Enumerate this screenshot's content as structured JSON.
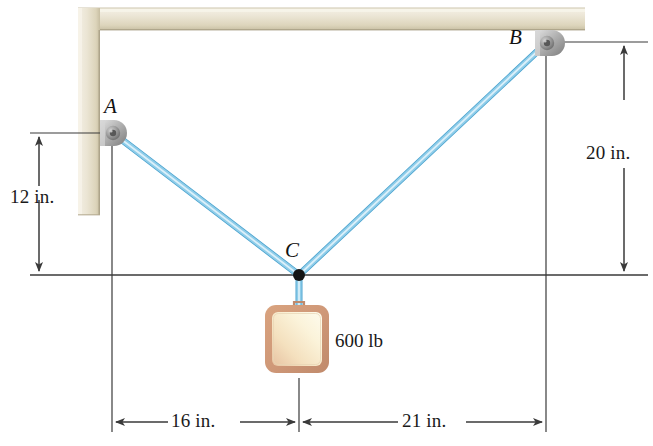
{
  "figure": {
    "background_color": "#ffffff"
  },
  "points": [
    {
      "id": "A",
      "label": "A",
      "label_x": 106,
      "label_y": 97,
      "x": 112,
      "y": 133,
      "role": "left-wall-anchor"
    },
    {
      "id": "B",
      "label": "B",
      "label_x": 511,
      "label_y": 28,
      "x": 546,
      "y": 42,
      "role": "ceiling-anchor"
    },
    {
      "id": "C",
      "label": "C",
      "label_x": 286,
      "label_y": 240,
      "x": 299,
      "y": 275,
      "role": "cable-junction"
    }
  ],
  "dimensions": [
    {
      "id": "dim-12in",
      "label": "12 in.",
      "orientation": "vertical",
      "value": 12,
      "unit": "in.",
      "axis_x": 39,
      "from_y": 133,
      "to_y": 275,
      "label_x": 10,
      "label_y": 192
    },
    {
      "id": "dim-20in",
      "label": "20 in.",
      "orientation": "vertical",
      "value": 20,
      "unit": "in.",
      "axis_x": 624,
      "from_y": 42,
      "to_y": 275,
      "label_x": 588,
      "label_y": 148
    },
    {
      "id": "dim-16in",
      "label": "16 in.",
      "orientation": "horizontal",
      "value": 16,
      "unit": "in.",
      "axis_y": 422,
      "from_x": 112,
      "to_x": 299,
      "label_x": 173,
      "label_y": 408
    },
    {
      "id": "dim-21in",
      "label": "21 in.",
      "orientation": "horizontal",
      "value": 21,
      "unit": "in.",
      "axis_y": 422,
      "from_x": 299,
      "to_x": 546,
      "label_x": 404,
      "label_y": 408
    }
  ],
  "load": {
    "label": "600 lb",
    "value": 600,
    "unit": "lb",
    "label_x": 335,
    "label_y": 329,
    "block": {
      "x": 265,
      "y": 305,
      "width": 64,
      "height": 68
    }
  },
  "cables": [
    {
      "id": "cable-AC",
      "from": "A",
      "to": "C"
    },
    {
      "id": "cable-BC",
      "from": "B",
      "to": "C"
    },
    {
      "id": "cable-C-load",
      "from": "C",
      "to": "load"
    }
  ],
  "structure": {
    "ceiling_beam": {
      "x": 78,
      "y": 8,
      "width": 507,
      "height": 22
    },
    "wall_column": {
      "x": 78,
      "y": 8,
      "width": 22,
      "height": 207
    }
  },
  "colors": {
    "cable": "#7ec5e8",
    "cable_highlight": "#d8eef8",
    "cable_edge": "#4ba3cf",
    "beam_light": "#efeade",
    "beam_mid": "#e2dcc8",
    "beam_dark": "#cfc6ac",
    "bracket_light": "#d8d8d8",
    "bracket_mid": "#a8a8a8",
    "bracket_dark": "#7a7a7a",
    "block_border": "#cf9878",
    "block_fill_light": "#fdf6dd",
    "block_fill_mid": "#f2ddb8",
    "line": "#3a3a3a",
    "text": "#1a1a1a"
  },
  "reference_lines": {
    "horizontal_through_C": {
      "y": 275,
      "from_x": 30,
      "to_x": 648
    },
    "vertical_at_A": {
      "x": 112,
      "from_y": 140,
      "to_y": 432
    },
    "vertical_at_C": {
      "x": 299,
      "from_y": 378,
      "to_y": 432
    },
    "vertical_at_B": {
      "x": 546,
      "from_y": 48,
      "to_y": 432
    },
    "top_tick_20in": {
      "y": 42,
      "from_x": 560,
      "to_x": 648
    },
    "top_tick_12in": {
      "y": 133,
      "from_x": 30,
      "to_x": 100
    }
  }
}
